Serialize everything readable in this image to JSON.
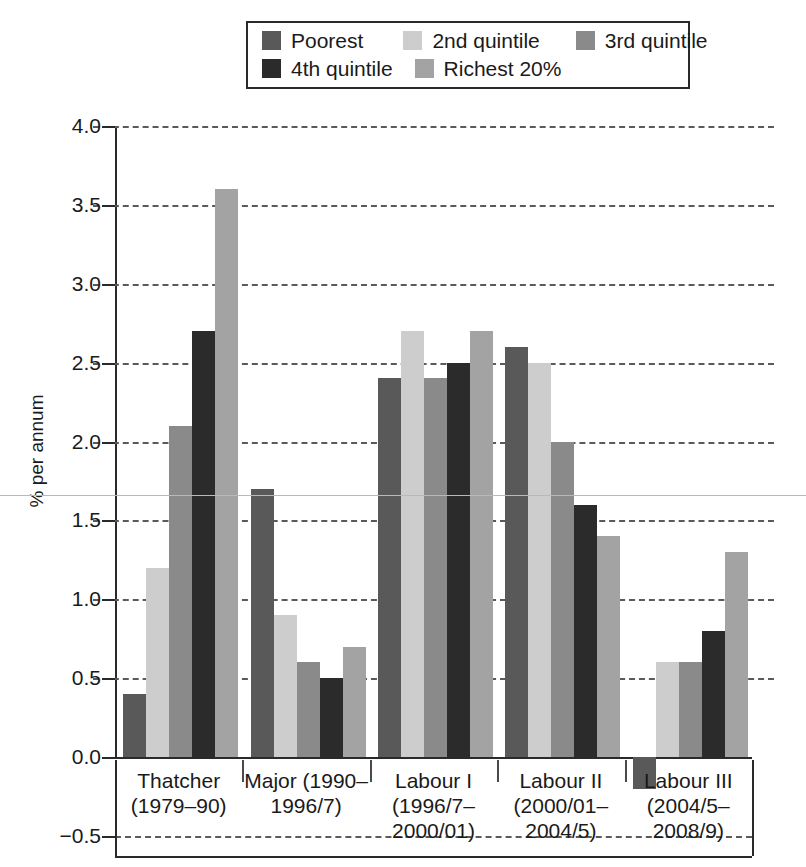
{
  "chart_data": {
    "type": "bar",
    "title": "",
    "subtitle": "",
    "xlabel": "",
    "ylabel": "% per annum",
    "ylim": [
      -0.5,
      4.0
    ],
    "ytick_step": 0.5,
    "grid": true,
    "grid_style": "dashed horizontal",
    "legend_position": "top-center",
    "orientation": "vertical",
    "grouping": "clustered",
    "categories": [
      "Thatcher\n(1979–90)",
      "Major (1990–\n1996/7)",
      "Labour I\n(1996/7–\n2000/01)",
      "Labour II\n(2000/01–\n2004/5)",
      "Labour III\n(2004/5–\n2008/9)"
    ],
    "category_lines": [
      [
        "Thatcher",
        "(1979–90)"
      ],
      [
        "Major (1990–",
        "1996/7)"
      ],
      [
        "Labour I",
        "(1996/7–",
        "2000/01)"
      ],
      [
        "Labour II",
        "(2000/01–",
        "2004/5)"
      ],
      [
        "Labour III",
        "(2004/5–",
        "2008/9)"
      ]
    ],
    "ytick_labels": [
      "4.0",
      "3.5",
      "3.0",
      "2.5",
      "2.0",
      "1.5",
      "1.0",
      "0.5",
      "0.0",
      "−0.5"
    ],
    "ytick_values": [
      4.0,
      3.5,
      3.0,
      2.5,
      2.0,
      1.5,
      1.0,
      0.5,
      0.0,
      -0.5
    ],
    "series": [
      {
        "name": "Poorest",
        "color": "#595959",
        "values": [
          0.4,
          1.7,
          2.4,
          2.6,
          -0.2
        ]
      },
      {
        "name": "2nd quintile",
        "color": "#cdcdcd",
        "values": [
          1.2,
          0.9,
          2.7,
          2.5,
          0.6
        ]
      },
      {
        "name": "3rd quintile",
        "color": "#8a8a8a",
        "values": [
          2.1,
          0.6,
          2.4,
          2.0,
          0.6
        ]
      },
      {
        "name": "4th quintile",
        "color": "#2b2b2b",
        "values": [
          2.7,
          0.5,
          2.5,
          1.6,
          0.8
        ]
      },
      {
        "name": "Richest 20%",
        "color": "#a3a3a3",
        "values": [
          3.6,
          0.7,
          2.7,
          1.4,
          1.3
        ]
      }
    ],
    "reference_line": {
      "value": 1.66,
      "color": "#b9b9b9",
      "style": "solid"
    }
  },
  "legend": {
    "rows": [
      [
        {
          "label": "Poorest",
          "swatch": "#595959",
          "icon": "legend-swatch-icon"
        },
        {
          "label": "2nd quintile",
          "swatch": "#cdcdcd",
          "icon": "legend-swatch-icon"
        },
        {
          "label": "3rd quintile",
          "swatch": "#8a8a8a",
          "icon": "legend-swatch-icon"
        }
      ],
      [
        {
          "label": "4th quintile",
          "swatch": "#2b2b2b",
          "icon": "legend-swatch-icon"
        },
        {
          "label": "Richest 20%",
          "swatch": "#a3a3a3",
          "icon": "legend-swatch-icon"
        }
      ]
    ]
  },
  "colors": {
    "axis": "#2a2a2a",
    "grid": "#5a5a5a",
    "text": "#1a1a1a",
    "background": "#ffffff",
    "reference_line": "#b9b9b9"
  }
}
